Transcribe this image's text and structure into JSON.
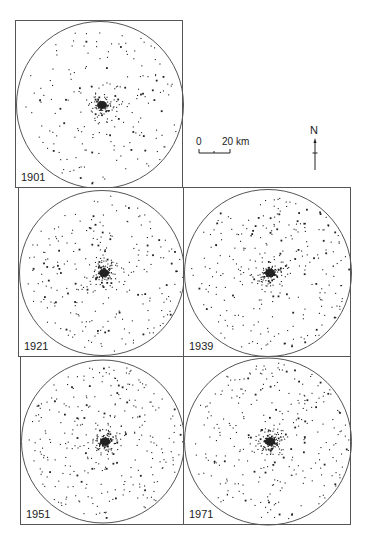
{
  "figure": {
    "panels": [
      {
        "id": "p1901",
        "year": "1901",
        "x": 15,
        "y": 20,
        "w": 168,
        "h": 168,
        "density": 0.75,
        "seed": 11
      },
      {
        "id": "p1921",
        "year": "1921",
        "x": 18,
        "y": 187,
        "w": 166,
        "h": 170,
        "density": 1.0,
        "seed": 23
      },
      {
        "id": "p1939",
        "year": "1939",
        "x": 183,
        "y": 187,
        "w": 168,
        "h": 170,
        "density": 1.05,
        "seed": 37
      },
      {
        "id": "p1951",
        "year": "1951",
        "x": 20,
        "y": 356,
        "w": 164,
        "h": 169,
        "density": 1.15,
        "seed": 41
      },
      {
        "id": "p1971",
        "year": "1971",
        "x": 183,
        "y": 356,
        "w": 168,
        "h": 169,
        "density": 1.15,
        "seed": 53
      }
    ],
    "scale_bar": {
      "zero_label": "0",
      "distance_label": "20 km"
    },
    "north_arrow": {
      "label": "N"
    },
    "colors": {
      "ink": "#222222",
      "frame": "#555555",
      "background": "#ffffff"
    }
  }
}
